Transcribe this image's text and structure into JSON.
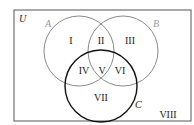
{
  "diagram": {
    "type": "venn",
    "universe_label": "U",
    "sets": [
      {
        "name": "A",
        "color": "#8a8a8a"
      },
      {
        "name": "B",
        "color": "#8a8a8a"
      },
      {
        "name": "C",
        "color": "#111111"
      }
    ],
    "regions": {
      "r1": "I",
      "r2": "II",
      "r3": "III",
      "r4": "IV",
      "r5": "V",
      "r6": "VI",
      "r7": "VII",
      "r8": "VIII"
    }
  }
}
